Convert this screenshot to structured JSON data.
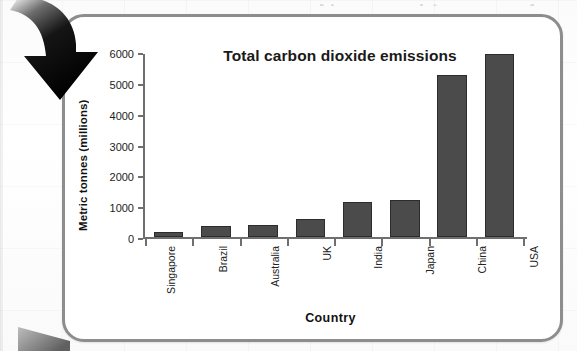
{
  "chart_data": {
    "type": "bar",
    "title": "Total carbon dioxide emissions",
    "xlabel": "Country",
    "ylabel": "Metric tonnes (millions)",
    "categories": [
      "Singapore",
      "Brazil",
      "Australia",
      "UK",
      "India",
      "Japan",
      "China",
      "USA"
    ],
    "values": [
      150,
      370,
      400,
      570,
      1120,
      1200,
      5250,
      5920
    ],
    "yticks": [
      0,
      1000,
      2000,
      3000,
      4000,
      5000,
      6000
    ],
    "ylim": [
      0,
      6000
    ],
    "grid": false,
    "legend": null,
    "series": [
      {
        "name": "Total carbon dioxide emissions",
        "values": [
          150,
          370,
          400,
          570,
          1120,
          1200,
          5250,
          5920
        ]
      }
    ]
  },
  "colors": {
    "bar_fill": "#4b4b4b",
    "bar_stroke": "#2c2c2c",
    "axis": "#6f6f6f",
    "panel_border": "#8d8d8d",
    "panel_background": "#ffffff",
    "text": "#1a1a1a",
    "annotation_arrow": "#000000"
  },
  "annotations": {
    "arrow": "curved-down-right-arrow"
  }
}
